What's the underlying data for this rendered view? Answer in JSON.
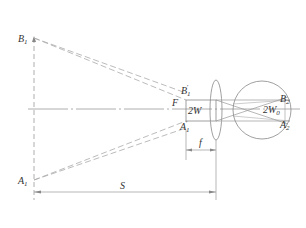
{
  "diagram": {
    "type": "optical-magnifier-ray-diagram",
    "labels": {
      "B1": "B",
      "B1_sub": "1",
      "A1": "A",
      "A1_sub": "1",
      "B1p": "B",
      "B1p_sub": "1",
      "B1p_sup": "′",
      "A1p": "A",
      "A1p_sub": "1",
      "A1p_sup": "′",
      "F": "F",
      "twoW": "2W",
      "B2": "B",
      "B2_sub": "2",
      "A2": "A",
      "A2_sub": "2",
      "twoW0": "2W",
      "twoW0_sub": "0",
      "f": "f",
      "S": "S"
    },
    "colors": {
      "line": "#888888",
      "dashed": "#aaaaaa",
      "text": "#333333"
    }
  }
}
